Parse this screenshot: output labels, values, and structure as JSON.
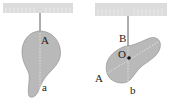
{
  "figure": {
    "left_panel": {
      "labels": {
        "suspension_point": "A",
        "line_end": "a"
      }
    },
    "right_panel": {
      "labels": {
        "suspension_point": "B",
        "center": "O",
        "previous_line_start": "A",
        "line_end": "b"
      }
    },
    "colors": {
      "ceiling": "#dcdcdc",
      "plate_fill": "#b9b9b9",
      "plate_edge": "#8a8a8a",
      "string": "#333333",
      "dashed_line": "#f2f2f2",
      "center_dot": "#111111"
    }
  }
}
